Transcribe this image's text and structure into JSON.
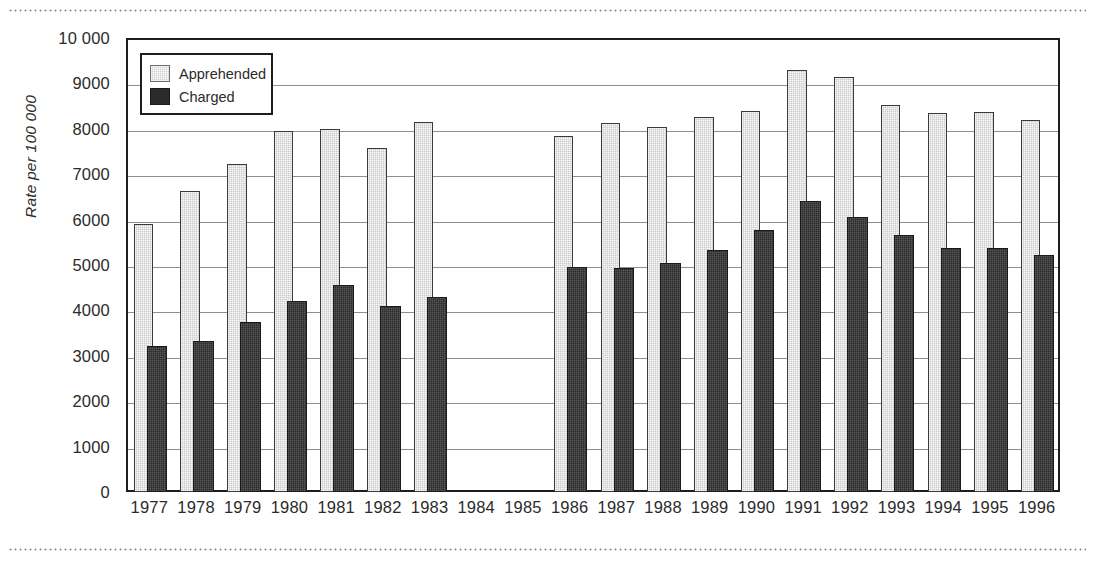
{
  "chart_data": {
    "type": "bar",
    "title": "",
    "subtitle": "",
    "xlabel": "",
    "ylabel": "Rate per 100 000",
    "ylim": [
      0,
      10000
    ],
    "ytick_step": 1000,
    "ytick_labels": [
      "10 000",
      "9000",
      "8000",
      "7000",
      "6000",
      "5000",
      "4000",
      "3000",
      "2000",
      "1000",
      "0"
    ],
    "ytick_values": [
      10000,
      9000,
      8000,
      7000,
      6000,
      5000,
      4000,
      3000,
      2000,
      1000,
      0
    ],
    "grid": "horizontal",
    "legend_position": "top-left-inside",
    "categories": [
      "1977",
      "1978",
      "1979",
      "1980",
      "1981",
      "1982",
      "1983",
      "1984",
      "1985",
      "1986",
      "1987",
      "1988",
      "1989",
      "1990",
      "1991",
      "1992",
      "1993",
      "1994",
      "1995",
      "1996"
    ],
    "series": [
      {
        "name": "Apprehended",
        "color": "#c9c9c9",
        "values": [
          5900,
          6620,
          7230,
          7950,
          7990,
          7570,
          8160,
          null,
          null,
          7840,
          8120,
          8040,
          8270,
          8390,
          9300,
          9150,
          8520,
          8340,
          8360,
          8190
        ]
      },
      {
        "name": "Charged",
        "color": "#2b2b2b",
        "values": [
          3220,
          3320,
          3740,
          4210,
          4570,
          4100,
          4290,
          null,
          null,
          4960,
          4930,
          5050,
          5320,
          5770,
          6420,
          6060,
          5670,
          5370,
          5370,
          5210
        ]
      }
    ]
  },
  "legend": {
    "items": [
      {
        "label": "Apprehended",
        "swatch": "light-gray-hatched"
      },
      {
        "label": "Charged",
        "swatch": "dark-solid"
      }
    ]
  },
  "axis": {
    "y_title": "Rate per 100 000"
  }
}
